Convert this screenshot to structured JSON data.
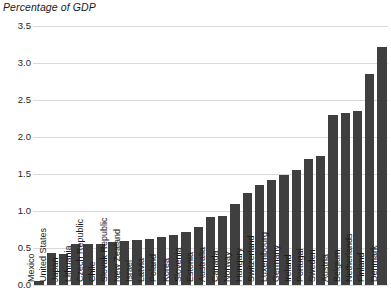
{
  "chart_data": {
    "type": "bar",
    "title": "Percentage of GDP",
    "xlabel": "",
    "ylabel": "",
    "ylim": [
      0.0,
      3.5
    ],
    "yticks": [
      "0.0",
      "0.5",
      "1.0",
      "1.5",
      "2.0",
      "2.5",
      "3.0",
      "3.5"
    ],
    "ytick_values": [
      0.0,
      0.5,
      1.0,
      1.5,
      2.0,
      2.5,
      3.0,
      3.5
    ],
    "grid": true,
    "legend": "none",
    "bar_color": "#3f3f3f",
    "categories": [
      "Mexico",
      "United States",
      "Japan",
      "Lithuania",
      "Czech Republic",
      "Chile",
      "Slovak Republic",
      "New Zealand",
      "Israel",
      "Latvia",
      "Poland",
      "Korea",
      "Slovenia",
      "Estonia",
      "Australia",
      "Canada",
      "Norway",
      "Hungary",
      "Switzerland",
      "Luxembourg",
      "Germany",
      "Ireland",
      "Portugal",
      "Sweden",
      "Austria",
      "Belgium",
      "Netherlands",
      "Finland",
      "Denmark"
    ],
    "values": [
      0.05,
      0.43,
      0.42,
      0.55,
      0.56,
      0.56,
      0.58,
      0.6,
      0.61,
      0.62,
      0.65,
      0.68,
      0.72,
      0.78,
      0.92,
      0.93,
      1.1,
      1.25,
      1.35,
      1.42,
      1.48,
      1.55,
      1.7,
      1.75,
      2.3,
      2.32,
      2.35,
      2.85,
      3.22
    ]
  }
}
